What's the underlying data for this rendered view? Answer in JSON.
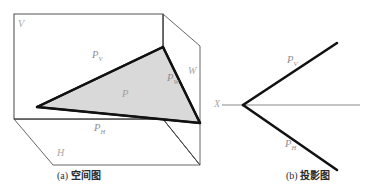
{
  "figure": {
    "title_none": "",
    "panels": [
      {
        "id": "panel-a",
        "caption_index": "(a)",
        "caption_text": "空间图",
        "description": "spatial-diagram-three-projection-planes-with-oblique-plane-P",
        "labels": {
          "plane_v": "V",
          "plane_h": "H",
          "plane_w": "W",
          "trace_pv": "P",
          "trace_pv_sub": "V",
          "trace_ph": "P",
          "trace_ph_sub": "H",
          "trace_pw": "P",
          "trace_pw_sub": "W",
          "face_p": "P"
        }
      },
      {
        "id": "panel-b",
        "caption_index": "(b)",
        "caption_text": "投影图",
        "description": "projection-diagram-traces-meeting-on-X-axis",
        "labels": {
          "axis_x": "X",
          "trace_pv": "P",
          "trace_pv_sub": "V",
          "trace_ph": "P",
          "trace_ph_sub": "H"
        }
      }
    ],
    "colors": {
      "thin_line": "#555555",
      "thick_line": "#1a1a1a",
      "axis_line": "#8a8a8a",
      "plane_fill": "#d9d9d9",
      "label_gray": "#9a9a9a",
      "caption_black": "#2b2b2b",
      "background": "#ffffff"
    },
    "geometry": {
      "panel_a": {
        "v_plane_quad": "14,14 163,14 163,119 14,119",
        "box_top_right_edge": "163,14 200,46",
        "w_plane_quad": "163,14 200,46 200,165 163,119",
        "h_plane_quad": "14,119 163,119 200,165 53,165",
        "triangle": "37,107 163,47 200,123",
        "thick_edges": [
          "37,107 163,47",
          "163,47 200,123",
          "200,123 37,107"
        ]
      },
      "panel_b": {
        "vertex": "243,105",
        "pv_end": "337,43",
        "ph_end": "337,170",
        "axis_start": "222,105",
        "axis_end": "360,105"
      }
    }
  }
}
